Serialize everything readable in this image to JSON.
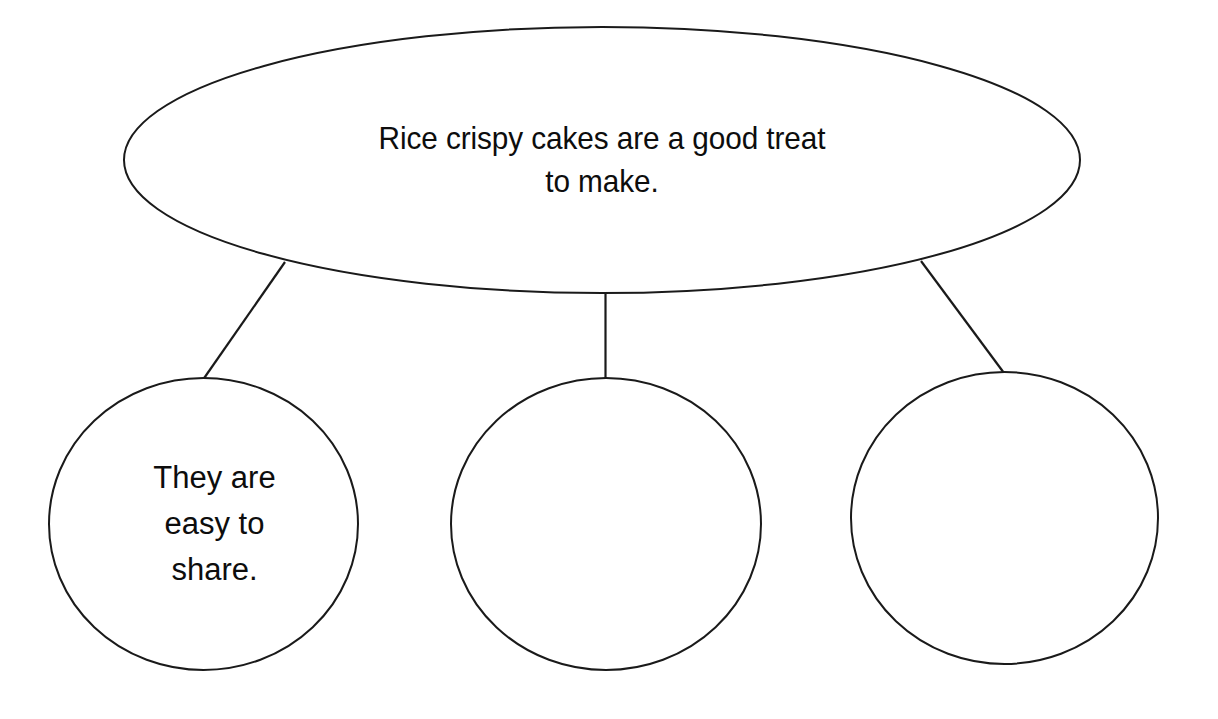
{
  "diagram": {
    "type": "graphic-organizer",
    "layout": "one-main-idea-with-three-supporting-detail-bubbles",
    "background_color": "#ffffff",
    "stroke_color": "#1a1a1a",
    "text_color": "#0d0d0d",
    "main_topic": {
      "shape": "ellipse",
      "text": "Rice crispy cakes are a good treat\nto make.",
      "line_1": "Rice crispy cakes are a good treat",
      "line_2": "to make.",
      "filled": true
    },
    "details": [
      {
        "shape": "circle",
        "text": "They are\neasy to\nshare.",
        "line_1": "They are",
        "line_2": "easy to",
        "line_3": "share.",
        "filled": true
      },
      {
        "shape": "circle",
        "text": "",
        "filled": false
      },
      {
        "shape": "circle",
        "text": "",
        "filled": false
      }
    ],
    "connectors": [
      {
        "from": "main-topic",
        "to": "detail-1",
        "orientation": "diagonal-left"
      },
      {
        "from": "main-topic",
        "to": "detail-2",
        "orientation": "vertical"
      },
      {
        "from": "main-topic",
        "to": "detail-3",
        "orientation": "diagonal-right"
      }
    ]
  }
}
